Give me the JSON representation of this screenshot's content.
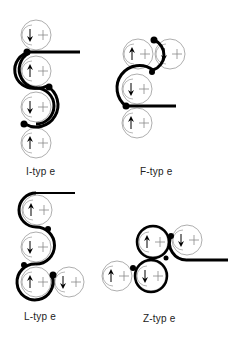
{
  "diagrams": [
    {
      "id": "i-type",
      "label": "I-typ e",
      "label_pos": [
        26,
        166
      ]
    },
    {
      "id": "f-type",
      "label": "F-typ e",
      "label_pos": [
        140,
        166
      ]
    },
    {
      "id": "l-type",
      "label": "L-typ e",
      "label_pos": [
        24,
        312
      ]
    },
    {
      "id": "z-type",
      "label": "Z-typ e",
      "label_pos": [
        143,
        314
      ]
    }
  ],
  "colors": {
    "roll_outline": "#999999",
    "belt": "#000000",
    "background": "#ffffff"
  }
}
